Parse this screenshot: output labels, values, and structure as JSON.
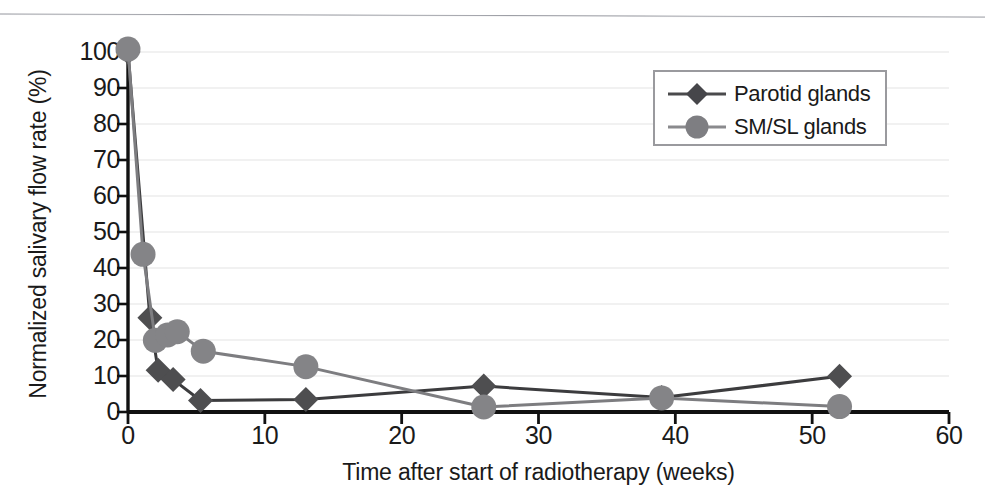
{
  "figure": {
    "background_color": "#ffffff",
    "axis_color": "#111111",
    "grid_color": "#ececed",
    "top_rule": "horizontal-rule"
  },
  "axes": {
    "y_label": "Normalized salivary flow rate (%)",
    "x_label": "Time after start of radiotherapy (weeks)",
    "y_ticks": [
      "0",
      "10",
      "20",
      "30",
      "40",
      "50",
      "60",
      "70",
      "80",
      "90",
      "100"
    ],
    "x_ticks": [
      "0",
      "10",
      "20",
      "30",
      "40",
      "50",
      "60"
    ]
  },
  "legend": {
    "position": "top-right",
    "entries": [
      {
        "label": "Parotid glands",
        "marker": "diamond",
        "color": "#4e4e50"
      },
      {
        "label": "SM/SL glands",
        "marker": "circle",
        "color": "#848487"
      }
    ]
  },
  "caption_fragment": "",
  "chart_data": {
    "type": "line",
    "title": "",
    "xlabel": "Time after start of radiotherapy (weeks)",
    "ylabel": "Normalized salivary flow rate (%)",
    "xlim": [
      0,
      60
    ],
    "ylim": [
      0,
      100
    ],
    "x_tick_step": 10,
    "y_tick_step": 10,
    "grid": "horizontal",
    "legend_position": "top-right",
    "series": [
      {
        "name": "Parotid glands",
        "marker": "diamond",
        "color": "#4e4e50",
        "line_color": "#3c3c3e",
        "points": [
          {
            "x": 0,
            "y": 100
          },
          {
            "x": 1.6,
            "y": 26.2
          },
          {
            "x": 2.2,
            "y": 11.6
          },
          {
            "x": 3.3,
            "y": 9.0
          },
          {
            "x": 5.3,
            "y": 3.2
          },
          {
            "x": 13,
            "y": 3.5
          },
          {
            "x": 26,
            "y": 7.2
          },
          {
            "x": 39,
            "y": 4.0
          },
          {
            "x": 52,
            "y": 9.9
          }
        ]
      },
      {
        "name": "SM/SL glands",
        "marker": "circle",
        "color": "#848487",
        "line_color": "#7d7d80",
        "points": [
          {
            "x": 0,
            "y": 100.8
          },
          {
            "x": 1.1,
            "y": 43.8
          },
          {
            "x": 2.0,
            "y": 19.9
          },
          {
            "x": 2.9,
            "y": 21.4
          },
          {
            "x": 3.6,
            "y": 22.3
          },
          {
            "x": 5.5,
            "y": 16.9
          },
          {
            "x": 13,
            "y": 12.6
          },
          {
            "x": 26,
            "y": 1.4
          },
          {
            "x": 39,
            "y": 3.9
          },
          {
            "x": 52,
            "y": 1.5
          }
        ]
      }
    ]
  }
}
